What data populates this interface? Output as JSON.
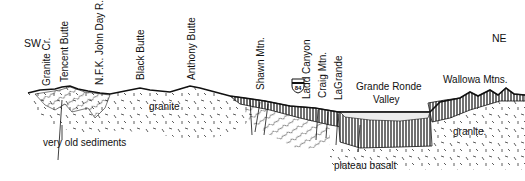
{
  "directions": {
    "left": "SW",
    "right": "NE"
  },
  "place_labels": [
    {
      "id": "granite-cr",
      "text": "Granite Cr."
    },
    {
      "id": "tencent-butte",
      "text": "Tencent Butte"
    },
    {
      "id": "nfk-john-day",
      "text": "N.F.K. John Day R."
    },
    {
      "id": "black-butte",
      "text": "Black Butte"
    },
    {
      "id": "anthony-butte",
      "text": "Anthony Butte"
    },
    {
      "id": "shawn-mtn",
      "text": "Shawn Mtn."
    },
    {
      "id": "ladd-canyon",
      "text": "Ladd Canyon"
    },
    {
      "id": "craig-mtn",
      "text": "Craig Mtn."
    },
    {
      "id": "lagrande",
      "text": "LaGrande"
    }
  ],
  "horizontal_labels": {
    "grande_ronde_line1": "Grande Ronde",
    "grande_ronde_line2": "Valley",
    "wallowa": "Wallowa Mtns."
  },
  "highway_shield": {
    "number": "84"
  },
  "rock_labels": {
    "granite_left": "granite",
    "granite_right": "granite.",
    "very_old_sediments": "very old sediments",
    "plateau_basalt": "plateau basalt"
  },
  "colors": {
    "ink": "#111111",
    "background": "#ffffff",
    "valley_fill": "#e8e8e8"
  }
}
